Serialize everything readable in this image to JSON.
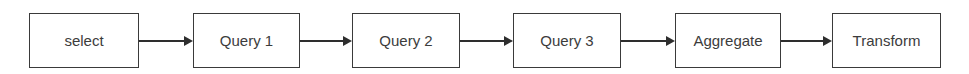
{
  "diagram": {
    "type": "linear-flow",
    "direction": "left-to-right",
    "nodes": [
      {
        "id": "select",
        "label": "select"
      },
      {
        "id": "query1",
        "label": "Query 1"
      },
      {
        "id": "query2",
        "label": "Query 2"
      },
      {
        "id": "query3",
        "label": "Query 3"
      },
      {
        "id": "aggregate",
        "label": "Aggregate"
      },
      {
        "id": "transform",
        "label": "Transform"
      }
    ],
    "edges": [
      {
        "from": "select",
        "to": "query1"
      },
      {
        "from": "query1",
        "to": "query2"
      },
      {
        "from": "query2",
        "to": "query3"
      },
      {
        "from": "query3",
        "to": "aggregate"
      },
      {
        "from": "aggregate",
        "to": "transform"
      }
    ],
    "colors": {
      "border": "#3a3a3a",
      "text": "#3c3c3c",
      "arrow": "#2e2e2e",
      "background": "#ffffff"
    }
  }
}
